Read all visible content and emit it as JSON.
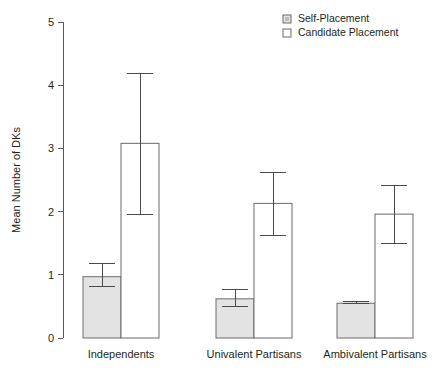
{
  "chart_data": {
    "type": "bar",
    "title": "",
    "xlabel": "",
    "ylabel": "Mean Number of DKs",
    "ylim": [
      0,
      5
    ],
    "yticks": [
      0,
      1,
      2,
      3,
      4,
      5
    ],
    "ytick_labels": [
      "0",
      "1",
      "2",
      "3",
      "4",
      "5"
    ],
    "grid": false,
    "legend_position": "top-right",
    "categories": [
      "Independents",
      "Univalent Partisans",
      "Ambivalent Partisans"
    ],
    "series": [
      {
        "name": "Self-Placement",
        "fill": "#e3e3e3",
        "values": [
          0.97,
          0.62,
          0.55
        ],
        "error_low": [
          0.82,
          0.5,
          0.54
        ],
        "error_high": [
          1.18,
          0.76,
          0.57
        ]
      },
      {
        "name": "Candidate Placement",
        "fill": "#ffffff",
        "values": [
          3.08,
          2.13,
          1.96
        ],
        "error_low": [
          1.96,
          1.62,
          1.5
        ],
        "error_high": [
          4.19,
          2.62,
          2.42
        ]
      }
    ]
  },
  "legend": {
    "items": [
      {
        "label": "Self-Placement"
      },
      {
        "label": "Candidate Placement"
      }
    ]
  },
  "colors": {
    "axis": "#5a5a5a",
    "text": "#231f20",
    "self_fill": "#e3e3e3",
    "candidate_fill": "#ffffff",
    "bar_stroke": "#6b6b6b",
    "error_stroke": "#4a4a4a"
  }
}
